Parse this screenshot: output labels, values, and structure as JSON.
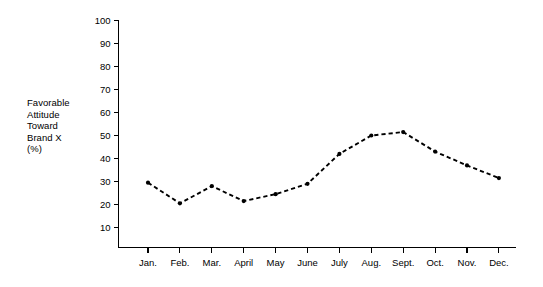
{
  "chart_data": {
    "type": "line",
    "title": "",
    "xlabel": "",
    "ylabel": "Favorable\nAttitude\nToward\nBrand X\n(%)",
    "categories": [
      "Jan.",
      "Feb.",
      "Mar.",
      "April",
      "May",
      "June",
      "July",
      "Aug.",
      "Sept.",
      "Oct.",
      "Nov.",
      "Dec."
    ],
    "values": [
      29.5,
      20.5,
      28,
      21.5,
      24.5,
      29,
      42,
      50,
      51.5,
      43,
      37,
      31.5
    ],
    "series": [
      {
        "name": "Favorable Attitude Toward Brand X (%)",
        "values": [
          29.5,
          20.5,
          28,
          21.5,
          24.5,
          29,
          42,
          50,
          51.5,
          43,
          37,
          31.5
        ]
      }
    ],
    "ylim": [
      0,
      100
    ],
    "yticks": [
      10,
      20,
      30,
      40,
      50,
      60,
      70,
      80,
      90,
      100
    ],
    "ytick_labels": [
      "10",
      "20",
      "30",
      "40",
      "50",
      "60",
      "70",
      "80",
      "90",
      "100"
    ],
    "grid": false,
    "legend": false,
    "legend_position": "none",
    "line_style": "dashed",
    "marker": "circle",
    "color": "#000000",
    "background": "#ffffff"
  }
}
